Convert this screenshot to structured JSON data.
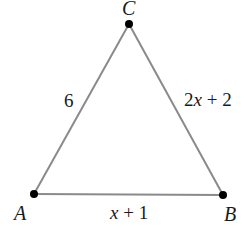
{
  "diagram": {
    "type": "triangle",
    "colors": {
      "edge": "#8a8a8a",
      "vertex": "#000000",
      "text": "#1a1a1a",
      "background": "#ffffff"
    },
    "vertices": {
      "A": {
        "label": "A",
        "x": 34,
        "y": 194
      },
      "B": {
        "label": "B",
        "x": 223,
        "y": 195
      },
      "C": {
        "label": "C",
        "x": 129,
        "y": 24
      }
    },
    "sides": {
      "AC": {
        "label": "6",
        "parts": {
          "coef": "6",
          "var": "",
          "rest": ""
        }
      },
      "CB": {
        "label": "2x + 2",
        "parts": {
          "coef": "2",
          "var": "x",
          "rest": " + 2"
        }
      },
      "AB": {
        "label": "x + 1",
        "parts": {
          "coef": "",
          "var": "x",
          "rest": " + 1"
        }
      }
    }
  }
}
